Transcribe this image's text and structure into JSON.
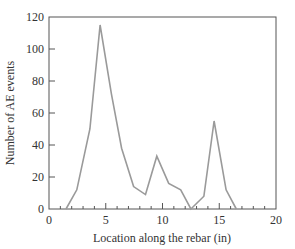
{
  "chart_data": {
    "type": "line",
    "title": "",
    "xlabel": "Location along the rebar (in)",
    "ylabel": "Number of AE events",
    "xlim": [
      0,
      20
    ],
    "ylim": [
      0,
      120
    ],
    "xticks": [
      0,
      5,
      10,
      15,
      20
    ],
    "yticks": [
      0,
      20,
      40,
      60,
      80,
      100,
      120
    ],
    "x_minor_tick_step": 1,
    "grid": false,
    "legend": null,
    "line_color": "#9a9a9a",
    "series": [
      {
        "name": "AE events",
        "x": [
          1.5,
          2.45,
          3.6,
          4.5,
          5.5,
          6.4,
          7.45,
          8.5,
          9.5,
          10.55,
          11.6,
          12.5,
          13.65,
          14.55,
          15.6,
          16.5
        ],
        "y": [
          0,
          12,
          50,
          115,
          72,
          38,
          14,
          9,
          33,
          16,
          12,
          0,
          8,
          55,
          12,
          0
        ]
      }
    ]
  }
}
